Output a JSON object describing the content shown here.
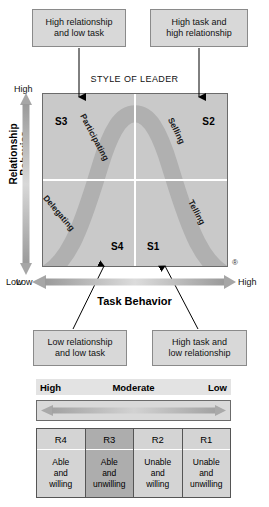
{
  "diagram": {
    "title": "STYLE OF LEADER",
    "registered_mark": "®"
  },
  "callouts": {
    "top_left": "High relationship\nand low task",
    "top_right": "High task and\nhigh relationship",
    "bottom_left": "Low relationship\nand low task",
    "bottom_right": "High task and\nlow relationship"
  },
  "axes": {
    "y_title": "Relationship Behavior",
    "y_high": "High",
    "y_low": "Low",
    "x_title": "Task Behavior",
    "x_low": "Low",
    "x_high": "High"
  },
  "quadrants": {
    "s3": "S3",
    "s2": "S2",
    "s4": "S4",
    "s1": "S1"
  },
  "curve_labels": {
    "participating": "Participating",
    "selling": "Selling",
    "delegating": "Delegating",
    "telling": "Telling"
  },
  "readiness": {
    "header": {
      "high": "High",
      "moderate": "Moderate",
      "low": "Low"
    },
    "columns": [
      {
        "code": "R4",
        "desc": "Able\nand\nwilling",
        "highlight": false
      },
      {
        "code": "R3",
        "desc": "Able\nand\nunwilling",
        "highlight": true
      },
      {
        "code": "R2",
        "desc": "Unable\nand\nwilling",
        "highlight": false
      },
      {
        "code": "R1",
        "desc": "Unable\nand\nunwilling",
        "highlight": false
      }
    ]
  },
  "colors": {
    "chart_background": "#c9c9c9",
    "curve_band": "#b0b0b0",
    "callout_fill": "#d8d8d8",
    "callout_border": "#8a8a8a",
    "highlight_cell": "#adadad",
    "arrow_gray": "#a8a8a8"
  }
}
